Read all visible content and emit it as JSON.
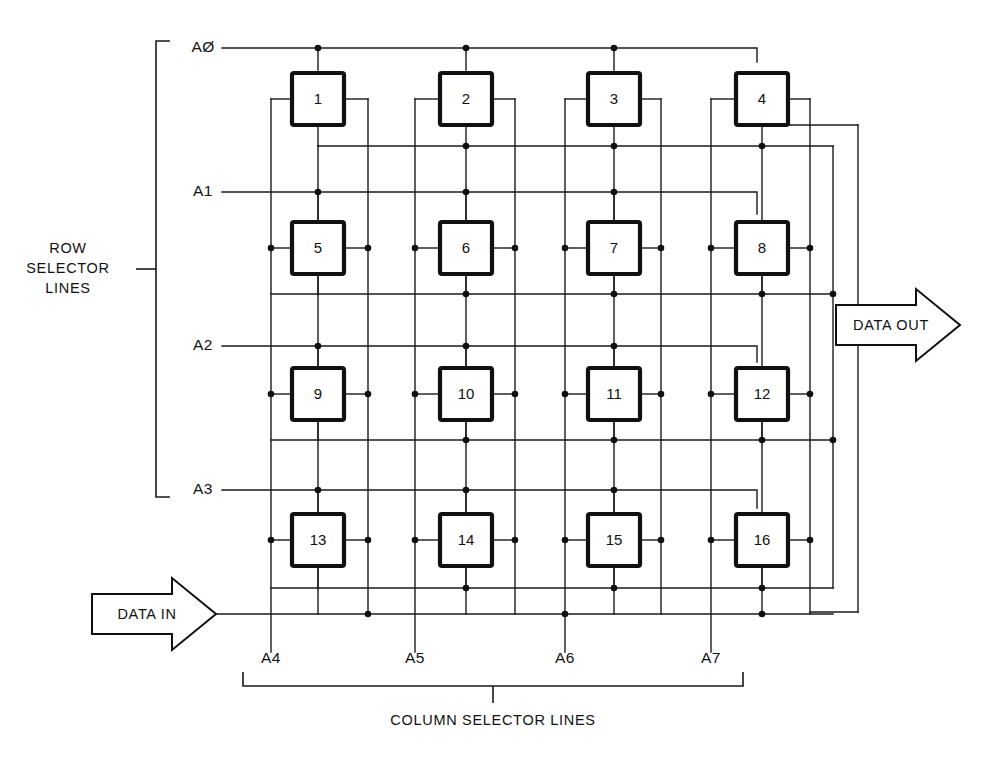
{
  "diagram": {
    "row_selector": {
      "caption_line1": "ROW",
      "caption_line2": "SELECTOR",
      "caption_line3": "LINES",
      "labels": [
        "AØ",
        "A1",
        "A2",
        "A3"
      ]
    },
    "column_selector": {
      "caption": "COLUMN SELECTOR LINES",
      "labels": [
        "A4",
        "A5",
        "A6",
        "A7"
      ]
    },
    "ports": {
      "data_in": "DATA IN",
      "data_out": "DATA OUT"
    },
    "cells": [
      {
        "label": "1",
        "row": 0,
        "col": 0
      },
      {
        "label": "2",
        "row": 0,
        "col": 1
      },
      {
        "label": "3",
        "row": 0,
        "col": 2
      },
      {
        "label": "4",
        "row": 0,
        "col": 3
      },
      {
        "label": "5",
        "row": 1,
        "col": 0
      },
      {
        "label": "6",
        "row": 1,
        "col": 1
      },
      {
        "label": "7",
        "row": 1,
        "col": 2
      },
      {
        "label": "8",
        "row": 1,
        "col": 3
      },
      {
        "label": "9",
        "row": 2,
        "col": 0
      },
      {
        "label": "10",
        "row": 2,
        "col": 1
      },
      {
        "label": "11",
        "row": 2,
        "col": 2
      },
      {
        "label": "12",
        "row": 2,
        "col": 3
      },
      {
        "label": "13",
        "row": 3,
        "col": 0
      },
      {
        "label": "14",
        "row": 3,
        "col": 1
      },
      {
        "label": "15",
        "row": 3,
        "col": 2
      },
      {
        "label": "16",
        "row": 3,
        "col": 3
      }
    ],
    "colors": {
      "ink": "#101010",
      "paper": "#ffffff"
    },
    "geometry": {
      "row_line_y": [
        48,
        192,
        346,
        490
      ],
      "cell_center_y": [
        99,
        248,
        394,
        540
      ],
      "cell_center_x": [
        318,
        466,
        614,
        762
      ],
      "cell_size": 52,
      "col_line_x": [
        271,
        318,
        368,
        415,
        466,
        515,
        565,
        614,
        661,
        711,
        762,
        810
      ],
      "out_bus_y": [
        146,
        294,
        440,
        588
      ],
      "right_bus_x": [
        833,
        858
      ],
      "bottom_bus_y": 614
    }
  }
}
